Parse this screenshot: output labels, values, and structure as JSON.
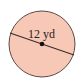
{
  "diagram": {
    "shape": "circle",
    "measurement": {
      "label": "12 yd",
      "type": "diameter",
      "value": 12,
      "unit": "yd"
    },
    "colors": {
      "fill": "#F7C8B6",
      "stroke": "#5a4a48",
      "line": "#3a2c2c",
      "center_dot": "#111111"
    }
  }
}
